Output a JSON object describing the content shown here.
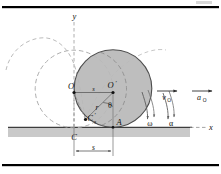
{
  "figure": {
    "page_marker": "",
    "colors": {
      "disk_fill": "#b9b9b9",
      "disk_stroke": "#4a4a4a",
      "dashed_stroke": "#9a9a9a",
      "ground_fill": "#c9c9c9",
      "ground_line": "#4a4a4a",
      "border_line": "#000000",
      "label_color": "#111111",
      "construction_line": "#6a6a6a"
    },
    "axes": {
      "y_label": "y",
      "x_label": "x"
    },
    "points": [
      {
        "id": "point-O",
        "label": "O",
        "prime": false,
        "x": 74,
        "y": 89
      },
      {
        "id": "point-O-prime",
        "label": "O",
        "prime": true,
        "x": 113,
        "y": 88
      },
      {
        "id": "point-C-prime",
        "label": "C",
        "prime": true,
        "x": 85,
        "y": 119
      },
      {
        "id": "point-A",
        "label": "A",
        "prime": false,
        "x": 113,
        "y": 123
      },
      {
        "id": "point-C",
        "label": "C",
        "prime": false,
        "x": 74,
        "y": 128
      }
    ],
    "dimensions": [
      {
        "id": "dim-s-top",
        "label": "s",
        "italic": true
      },
      {
        "id": "dim-s-bottom",
        "label": "s",
        "italic": true
      },
      {
        "id": "dim-s-small",
        "label": "s",
        "italic": true
      }
    ],
    "annotations": {
      "radius_label": "r",
      "angle_label": "θ",
      "angular_velocity_label": "ω",
      "angular_acceleration_label": "α",
      "velocity_label": "v",
      "velocity_subscript": "O",
      "acceleration_label": "a",
      "acceleration_subscript": "O"
    },
    "geometry": {
      "disk_center_x": 113,
      "disk_center_y": 88,
      "disk_radius": 39,
      "ghost_center_x": 74,
      "ghost_center_y": 89,
      "ghost_radius": 39,
      "ground_y": 127
    }
  }
}
